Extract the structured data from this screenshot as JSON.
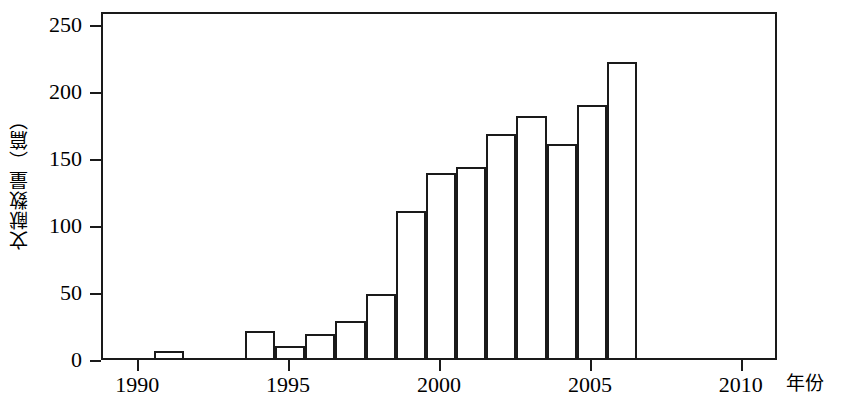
{
  "chart_data": {
    "type": "bar",
    "title": "",
    "xlabel": "年份",
    "ylabel": "文献数量（篇）",
    "categories": [
      1991,
      1994,
      1995,
      1996,
      1997,
      1998,
      1999,
      2000,
      2001,
      2002,
      2003,
      2004,
      2005,
      2006
    ],
    "values": [
      5,
      20,
      9,
      18,
      28,
      48,
      110,
      138,
      143,
      167,
      181,
      160,
      189,
      221
    ],
    "bars": [
      {
        "year": "1991",
        "value": 5
      },
      {
        "year": "1994",
        "value": 20
      },
      {
        "year": "1995",
        "value": 9
      },
      {
        "year": "1996",
        "value": 18
      },
      {
        "year": "1997",
        "value": 28
      },
      {
        "year": "1998",
        "value": 48
      },
      {
        "year": "1999",
        "value": 110
      },
      {
        "year": "2000",
        "value": 138
      },
      {
        "year": "2001",
        "value": 143
      },
      {
        "year": "2002",
        "value": 167
      },
      {
        "year": "2003",
        "value": 181
      },
      {
        "year": "2004",
        "value": 160
      },
      {
        "year": "2005",
        "value": 189
      },
      {
        "year": "2006",
        "value": 221
      }
    ],
    "ylim": [
      0,
      260
    ],
    "xlim": [
      1988.8,
      2011.2
    ],
    "y_ticks": [
      0,
      50,
      100,
      150,
      200,
      250
    ],
    "y_tick_labels": [
      "0",
      "50",
      "100",
      "150",
      "200",
      "250"
    ],
    "x_ticks": [
      1990,
      1995,
      2000,
      2005,
      2010
    ],
    "x_tick_labels": [
      "1990",
      "1995",
      "2000",
      "2005",
      "2010"
    ],
    "grid": false,
    "legend": null,
    "bar_face_color": "#ffffff",
    "bar_edge_color": "#1a1a1a",
    "axis_color": "#1a1a1a",
    "background_color": "#ffffff"
  },
  "axes": {
    "y_title": "文献数量（篇）",
    "x_title": "年份"
  }
}
